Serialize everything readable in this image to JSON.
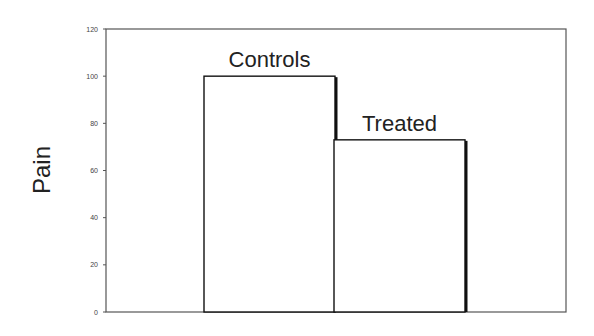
{
  "chart_data": {
    "type": "bar",
    "title": "",
    "xlabel": "",
    "ylabel": "Pain",
    "categories": [
      "Controls",
      "Treated"
    ],
    "values": [
      100,
      73
    ],
    "ylim": [
      0,
      120
    ],
    "yticks": [
      0,
      20,
      40,
      60,
      80,
      100,
      120
    ],
    "grid": false,
    "legend": null,
    "bar_labels": [
      "Controls",
      "Treated"
    ],
    "bar_fill": "#ffffff",
    "bar_stroke": "#111111"
  }
}
